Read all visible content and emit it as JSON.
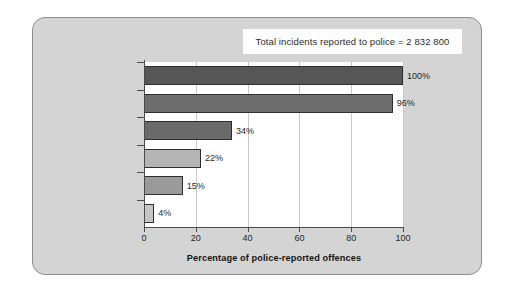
{
  "figure": {
    "background_color": "#ffffff",
    "panel_color": "#d4d4d4",
    "panel_border_color": "#8e8e8e",
    "plot_background": "#ffffff"
  },
  "title_box": {
    "text": "Total incidents reported to police = 2 832 800",
    "background": "#ffffff"
  },
  "axis_title": "Percentage of police-reported offences",
  "chart_data": {
    "type": "bar",
    "orientation": "horizontal",
    "title": "Total incidents reported to police = 2 832 800",
    "xlabel": "Percentage of police-reported offences",
    "ylabel": "",
    "xlim": [
      0,
      100
    ],
    "xticks": [
      0,
      20,
      40,
      60,
      80,
      100
    ],
    "xticklabels": [
      "0",
      "20",
      "40",
      "60",
      "80",
      "100"
    ],
    "grid": "vertical-dotted",
    "legend": "none",
    "categories": [
      "Offences reported to police",
      "Offences recorded as actual¹",
      "Offences cleared",
      "Offences cleared by charge",
      "Convictions",
      "Sentenced to custody²"
    ],
    "values": [
      100,
      96,
      34,
      22,
      15,
      4
    ],
    "value_labels": [
      "100%",
      "96%",
      "34%",
      "22%",
      "15%",
      "4%"
    ],
    "bar_colors": [
      "#565656",
      "#6e6e6e",
      "#6a6a6a",
      "#b4b4b4",
      "#9a9a9a",
      "#c6c6c6"
    ]
  },
  "bars": [
    {
      "label_line1": "Offences reported",
      "label_line2": "to police",
      "sup": "",
      "value": 100,
      "value_label": "100%",
      "color": "#565656"
    },
    {
      "label_line1": "Offences recorded",
      "label_line2": "as actual",
      "sup": "1",
      "value": 96,
      "value_label": "96%",
      "color": "#6e6e6e"
    },
    {
      "label_line1": "Offences cleared",
      "label_line2": "",
      "sup": "",
      "value": 34,
      "value_label": "34%",
      "color": "#6a6a6a"
    },
    {
      "label_line1": "Offences cleared",
      "label_line2": "by charge",
      "sup": "",
      "value": 22,
      "value_label": "22%",
      "color": "#b4b4b4"
    },
    {
      "label_line1": "Convictions",
      "label_line2": "",
      "sup": "",
      "value": 15,
      "value_label": "15%",
      "color": "#9a9a9a"
    },
    {
      "label_line1": "Sentenced",
      "label_line2": "to custody",
      "sup": "2",
      "value": 4,
      "value_label": "4%",
      "color": "#c6c6c6"
    }
  ],
  "xticklabels": [
    "0",
    "20",
    "40",
    "60",
    "80",
    "100"
  ]
}
